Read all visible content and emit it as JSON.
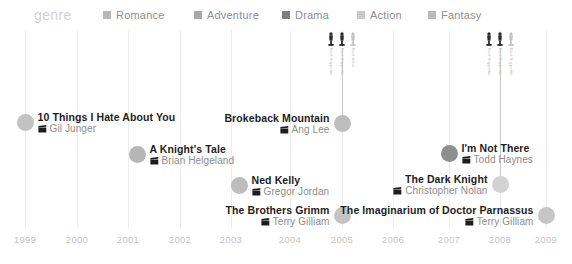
{
  "legend": {
    "title": "genre",
    "items": [
      {
        "label": "Romance",
        "color": "#b8b8b8",
        "x": 103
      },
      {
        "label": "Adventure",
        "color": "#a8a8a8",
        "x": 194
      },
      {
        "label": "Drama",
        "color": "#7d7d7d",
        "x": 282
      },
      {
        "label": "Action",
        "color": "#c9c9c9",
        "x": 357
      },
      {
        "label": "Fantasy",
        "color": "#bcbcbc",
        "x": 428
      }
    ]
  },
  "chart_data": {
    "type": "scatter",
    "title": "genre",
    "xlabel": "",
    "ylabel": "",
    "xlim": [
      1999,
      2009
    ],
    "grid": true,
    "legend_position": "top",
    "categories": [
      "Romance",
      "Adventure",
      "Drama",
      "Action",
      "Fantasy"
    ],
    "tick_labels": [
      "1999",
      "2000",
      "2001",
      "2002",
      "2003",
      "2004",
      "2005",
      "2006",
      "2007",
      "2008",
      "2009"
    ],
    "points": [
      {
        "title": "10 Things I Hate About You",
        "director": "Gil Junger",
        "year": 1999,
        "genre": "Romance",
        "color": "#c2c2c2",
        "side": "right",
        "dot_x": 25,
        "dot_y": 119
      },
      {
        "title": "A Knight's Tale",
        "director": "Brian Helgeland",
        "year": 2001,
        "genre": "Adventure",
        "color": "#b6b6b6",
        "side": "right",
        "dot_x": 137,
        "dot_y": 151
      },
      {
        "title": "Ned Kelly",
        "director": "Gregor Jordan",
        "year": 2003,
        "genre": "Drama",
        "color": "#bdbdbd",
        "side": "right",
        "dot_x": 239,
        "dot_y": 182
      },
      {
        "title": "The Brothers Grimm",
        "director": "Terry Gilliam",
        "year": 2005,
        "genre": "Fantasy",
        "color": "#c4c4c4",
        "side": "left",
        "dot_x": 342,
        "dot_y": 212
      },
      {
        "title": "Brokeback Mountain",
        "director": "Ang Lee",
        "year": 2005,
        "genre": "Drama",
        "color": "#bdbdbd",
        "side": "left",
        "dot_x": 342,
        "dot_y": 120
      },
      {
        "title": "I'm Not There",
        "director": "Todd Haynes",
        "year": 2007,
        "genre": "Drama",
        "color": "#8e8e8e",
        "side": "right",
        "dot_x": 449,
        "dot_y": 150
      },
      {
        "title": "The Dark Knight",
        "director": "Christopher Nolan",
        "year": 2008,
        "genre": "Action",
        "color": "#d2d2d2",
        "side": "left",
        "dot_x": 500,
        "dot_y": 181
      },
      {
        "title": "The Imaginarium of Doctor Parnassus",
        "director": "Terry Gilliam",
        "year": 2009,
        "genre": "Fantasy",
        "color": "#c6c6c6",
        "side": "left",
        "dot_x": 546,
        "dot_y": 212
      }
    ],
    "awards": [
      {
        "year": 2005,
        "x": 342,
        "stem_top": 48,
        "stem_height": 72,
        "trophies": [
          {
            "caption": "Best Supporting Actor",
            "filled": true
          },
          {
            "caption": "Best Supporting Actor",
            "filled": true
          },
          {
            "caption": "Best Actor",
            "filled": false
          }
        ]
      },
      {
        "year": 2008,
        "x": 500,
        "stem_top": 48,
        "stem_height": 133,
        "trophies": [
          {
            "caption": "Best Supporting Actor",
            "filled": true
          },
          {
            "caption": "Best Supporting Actor",
            "filled": true
          },
          {
            "caption": "Best Supporting Actor",
            "filled": false
          }
        ]
      }
    ],
    "gridlines_x": [
      25,
      77,
      128,
      180,
      231,
      290,
      342,
      393,
      449,
      500,
      546
    ]
  }
}
